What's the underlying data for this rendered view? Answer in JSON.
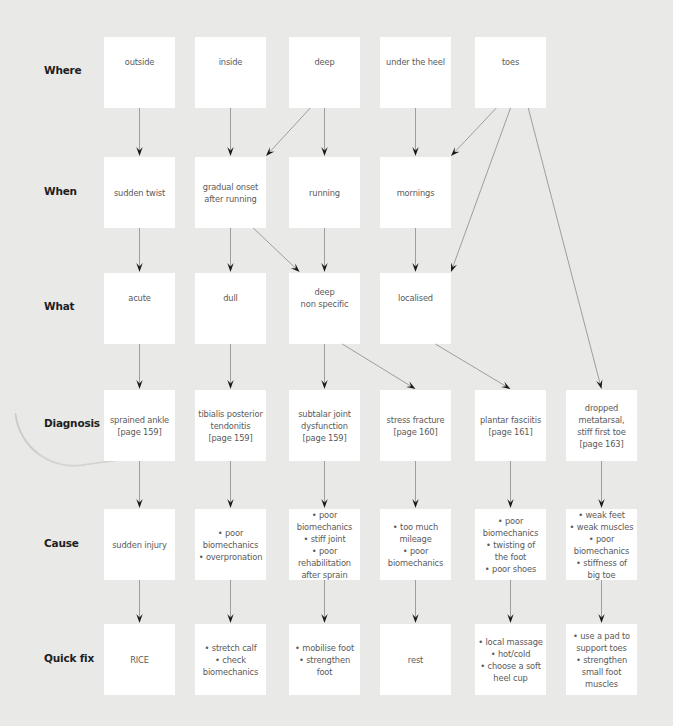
{
  "colors": {
    "background": "#e9e9e7",
    "node_fill": "#ffffff",
    "node_text": "#5a5a5a",
    "label_text": "#1e1e1e",
    "edge": "#8a8a8a",
    "arrowhead": "#1a1a1a"
  },
  "rows": [
    {
      "id": "where",
      "label": "Where"
    },
    {
      "id": "when",
      "label": "When"
    },
    {
      "id": "what",
      "label": "What"
    },
    {
      "id": "diagnosis",
      "label": "Diagnosis"
    },
    {
      "id": "cause",
      "label": "Cause"
    },
    {
      "id": "quickfix",
      "label": "Quick fix"
    }
  ],
  "nodes": {
    "where": [
      {
        "col": 0,
        "text": "outside"
      },
      {
        "col": 1,
        "text": "inside"
      },
      {
        "col": 2,
        "text": "deep"
      },
      {
        "col": 3,
        "text": "under the heel"
      },
      {
        "col": 4,
        "text": "toes"
      }
    ],
    "when": [
      {
        "col": 0,
        "text": "sudden twist"
      },
      {
        "col": 1,
        "text": "gradual onset\nafter running"
      },
      {
        "col": 2,
        "text": "running"
      },
      {
        "col": 3,
        "text": "mornings"
      }
    ],
    "what": [
      {
        "col": 0,
        "text": "acute"
      },
      {
        "col": 1,
        "text": "dull"
      },
      {
        "col": 2,
        "text": "deep\nnon specific"
      },
      {
        "col": 3,
        "text": "localised"
      }
    ],
    "diagnosis": [
      {
        "col": 0,
        "text": "sprained ankle\n[page 159]"
      },
      {
        "col": 1,
        "text": "tibialis posterior\ntendonitis\n[page 159]"
      },
      {
        "col": 2,
        "text": "subtalar joint\ndysfunction\n[page 159]"
      },
      {
        "col": 3,
        "text": "stress fracture\n[page 160]"
      },
      {
        "col": 4,
        "text": "plantar fasciitis\n[page 161]"
      },
      {
        "col": 5,
        "text": "dropped\nmetatarsal,\nstiff first toe\n[page 163]"
      }
    ],
    "cause": [
      {
        "col": 0,
        "text": "sudden injury"
      },
      {
        "col": 1,
        "text": "• poor\nbiomechanics\n• overpronation"
      },
      {
        "col": 2,
        "text": "• poor\nbiomechanics\n• stiff joint\n• poor\nrehabilitation\nafter sprain"
      },
      {
        "col": 3,
        "text": "• too much\nmileage\n• poor\nbiomechanics"
      },
      {
        "col": 4,
        "text": "• poor\nbiomechanics\n• twisting of\nthe foot\n• poor shoes"
      },
      {
        "col": 5,
        "text": "• weak feet\n• weak muscles\n• poor\nbiomechanics\n• stiffness of\nbig toe"
      }
    ],
    "quickfix": [
      {
        "col": 0,
        "text": "RICE"
      },
      {
        "col": 1,
        "text": "• stretch calf\n• check\nbiomechanics"
      },
      {
        "col": 2,
        "text": "• mobilise foot\n• strengthen\nfoot"
      },
      {
        "col": 3,
        "text": "rest"
      },
      {
        "col": 4,
        "text": "• local massage\n• hot/cold\n• choose a soft\nheel cup"
      },
      {
        "col": 5,
        "text": "• use a pad to\nsupport toes\n• strengthen\nsmall foot\nmuscles"
      }
    ]
  },
  "edges": [
    {
      "from": "where.0",
      "to": "when.0"
    },
    {
      "from": "where.1",
      "to": "when.1"
    },
    {
      "from": "where.2",
      "to": "when.1"
    },
    {
      "from": "where.2",
      "to": "when.2"
    },
    {
      "from": "where.3",
      "to": "when.3"
    },
    {
      "from": "where.4",
      "to": "when.3"
    },
    {
      "from": "where.4",
      "to": "what.3"
    },
    {
      "from": "where.4",
      "to": "diagnosis.5"
    },
    {
      "from": "when.0",
      "to": "what.0"
    },
    {
      "from": "when.1",
      "to": "what.1"
    },
    {
      "from": "when.1",
      "to": "what.2"
    },
    {
      "from": "when.2",
      "to": "what.2"
    },
    {
      "from": "when.3",
      "to": "what.3"
    },
    {
      "from": "what.0",
      "to": "diagnosis.0"
    },
    {
      "from": "what.1",
      "to": "diagnosis.1"
    },
    {
      "from": "what.2",
      "to": "diagnosis.2"
    },
    {
      "from": "what.2",
      "to": "diagnosis.3"
    },
    {
      "from": "what.3",
      "to": "diagnosis.4"
    },
    {
      "from": "diagnosis.0",
      "to": "cause.0"
    },
    {
      "from": "diagnosis.1",
      "to": "cause.1"
    },
    {
      "from": "diagnosis.2",
      "to": "cause.2"
    },
    {
      "from": "diagnosis.3",
      "to": "cause.3"
    },
    {
      "from": "diagnosis.4",
      "to": "cause.4"
    },
    {
      "from": "diagnosis.5",
      "to": "cause.5"
    },
    {
      "from": "cause.0",
      "to": "quickfix.0"
    },
    {
      "from": "cause.1",
      "to": "quickfix.1"
    },
    {
      "from": "cause.2",
      "to": "quickfix.2"
    },
    {
      "from": "cause.3",
      "to": "quickfix.3"
    },
    {
      "from": "cause.4",
      "to": "quickfix.4"
    },
    {
      "from": "cause.5",
      "to": "quickfix.5"
    }
  ]
}
